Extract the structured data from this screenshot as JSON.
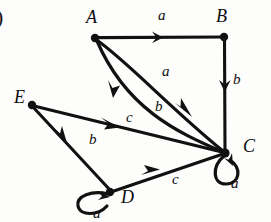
{
  "figure": {
    "corner_mark": ")",
    "ink_color": "#111111",
    "background_color": "#fdfdfb"
  },
  "vertices": [
    {
      "id": "A",
      "label": "A",
      "x": 95,
      "y": 38,
      "label_x": 86,
      "label_y": 8
    },
    {
      "id": "B",
      "label": "B",
      "x": 224,
      "y": 37,
      "label_x": 216,
      "label_y": 7
    },
    {
      "id": "C",
      "label": "C",
      "x": 225,
      "y": 153,
      "label_x": 243,
      "label_y": 137
    },
    {
      "id": "D",
      "label": "D",
      "x": 110,
      "y": 192,
      "label_x": 121,
      "label_y": 188
    },
    {
      "id": "E",
      "label": "E",
      "x": 32,
      "y": 105,
      "label_x": 14,
      "label_y": 88
    }
  ],
  "edges": [
    {
      "id": "B-A",
      "from": "B",
      "to": "A",
      "label": "a",
      "kind": "straight",
      "label_x": 158,
      "label_y": 8
    },
    {
      "id": "B-C",
      "from": "B",
      "to": "C",
      "label": "b",
      "kind": "straight",
      "label_x": 233,
      "label_y": 72
    },
    {
      "id": "A-C",
      "from": "A",
      "to": "C",
      "label": "a",
      "kind": "curve",
      "label_x": 162,
      "label_y": 64
    },
    {
      "id": "C-A",
      "from": "C",
      "to": "A",
      "label": "b",
      "kind": "curve",
      "label_x": 155,
      "label_y": 99
    },
    {
      "id": "E-C",
      "from": "E",
      "to": "C",
      "label": "c",
      "kind": "straight",
      "label_x": 126,
      "label_y": 110
    },
    {
      "id": "D-E",
      "from": "D",
      "to": "E",
      "label": "b",
      "kind": "straight",
      "label_x": 89,
      "label_y": 132
    },
    {
      "id": "D-C",
      "from": "D",
      "to": "C",
      "label": "c",
      "kind": "straight",
      "label_x": 172,
      "label_y": 172
    },
    {
      "id": "C-C",
      "from": "C",
      "to": "C",
      "label": "a",
      "kind": "loop",
      "label_x": 231,
      "label_y": 176
    },
    {
      "id": "D-D",
      "from": "D",
      "to": "D",
      "label": "a",
      "kind": "loop",
      "label_x": 93,
      "label_y": 206
    }
  ]
}
